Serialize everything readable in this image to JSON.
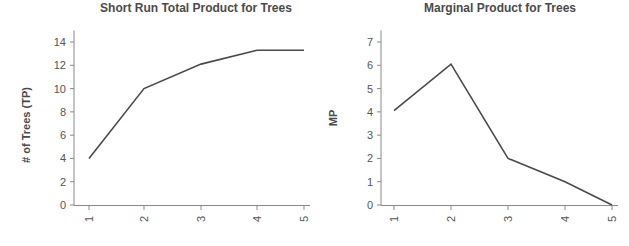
{
  "chart_data": [
    {
      "type": "line",
      "title": "Short Run Total Product for Trees",
      "xlabel": "",
      "ylabel": "# of Trees (TP)",
      "categories": [
        "1",
        "2",
        "3",
        "4",
        "5"
      ],
      "x": [
        1,
        2,
        3,
        4,
        5
      ],
      "series": [
        {
          "name": "TP",
          "values": [
            4,
            10,
            12.1,
            13.3,
            13.3
          ]
        }
      ],
      "yticks": [
        0,
        2,
        4,
        6,
        8,
        10,
        12,
        14
      ],
      "ylim": [
        0,
        15
      ],
      "grid": false,
      "legend": "none",
      "layout": {
        "plot_left": 74,
        "plot_right": 310,
        "y0_px": 205,
        "ytop_val": 14,
        "ytop_px": 42,
        "xtick_px": [
          89,
          144,
          201,
          257,
          304
        ]
      }
    },
    {
      "type": "line",
      "title": "Marginal Product for Trees",
      "xlabel": "",
      "ylabel": "MP",
      "categories": [
        "1",
        "2",
        "3",
        "4",
        "5"
      ],
      "x": [
        1,
        2,
        3,
        4,
        5
      ],
      "series": [
        {
          "name": "MP",
          "values": [
            4.05,
            6.05,
            2,
            1,
            0
          ]
        }
      ],
      "yticks": [
        0,
        1,
        2,
        3,
        4,
        5,
        6,
        7
      ],
      "ylim": [
        0,
        7.5
      ],
      "grid": false,
      "legend": "none",
      "layout": {
        "plot_left": 381,
        "plot_right": 618,
        "y0_px": 205,
        "ytop_val": 7,
        "ytop_px": 42,
        "xtick_px": [
          394,
          451,
          508,
          565,
          612
        ]
      }
    }
  ]
}
